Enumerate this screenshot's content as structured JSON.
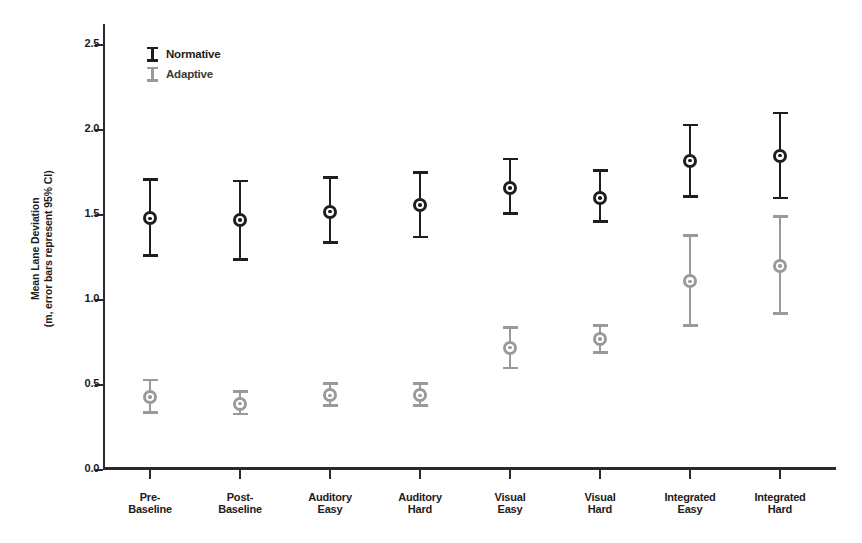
{
  "chart_data": {
    "type": "scatter",
    "title": "",
    "xlabel": "",
    "ylabel": "Mean Lane Deviation (m, error bars represent 95% CI)",
    "ylabel_line1": "Mean Lane Deviation",
    "ylabel_line2": "(m, error bars represent 95% CI)",
    "ylim": [
      0.0,
      2.6
    ],
    "ytick_values": [
      0.0,
      0.5,
      1.0,
      1.5,
      2.0,
      2.5
    ],
    "ytick_labels": [
      "0.0",
      "0.5",
      "1.0",
      "1.5",
      "2.0",
      "2.5"
    ],
    "grid": false,
    "legend_position": "top-left",
    "categories": [
      "Pre-Baseline",
      "Post-Baseline",
      "Auditory Easy",
      "Auditory Hard",
      "Visual Easy",
      "Visual Hard",
      "Integrated Easy",
      "Integrated Hard"
    ],
    "category_lines": [
      [
        "Pre-",
        "Baseline"
      ],
      [
        "Post-",
        "Baseline"
      ],
      [
        "Auditory",
        "Easy"
      ],
      [
        "Auditory",
        "Hard"
      ],
      [
        "Visual",
        "Easy"
      ],
      [
        "Visual",
        "Hard"
      ],
      [
        "Integrated",
        "Easy"
      ],
      [
        "Integrated",
        "Hard"
      ]
    ],
    "series": [
      {
        "name": "Normative",
        "color": "#1e1e1e",
        "values": [
          1.48,
          1.47,
          1.52,
          1.56,
          1.66,
          1.6,
          1.82,
          1.85
        ],
        "ci_low": [
          1.26,
          1.24,
          1.34,
          1.37,
          1.51,
          1.46,
          1.61,
          1.6
        ],
        "ci_high": [
          1.71,
          1.7,
          1.72,
          1.75,
          1.83,
          1.76,
          2.03,
          2.1
        ]
      },
      {
        "name": "Adaptive",
        "color": "#9a9a9a",
        "values": [
          0.43,
          0.39,
          0.44,
          0.44,
          0.72,
          0.77,
          1.11,
          1.2
        ],
        "ci_low": [
          0.34,
          0.33,
          0.38,
          0.38,
          0.6,
          0.69,
          0.85,
          0.92
        ],
        "ci_high": [
          0.53,
          0.46,
          0.51,
          0.51,
          0.84,
          0.85,
          1.38,
          1.49
        ]
      }
    ]
  },
  "legend": {
    "items": [
      {
        "label": "Normative",
        "color": "#1e1e1e"
      },
      {
        "label": "Adaptive",
        "color": "#9a9a9a"
      }
    ]
  }
}
